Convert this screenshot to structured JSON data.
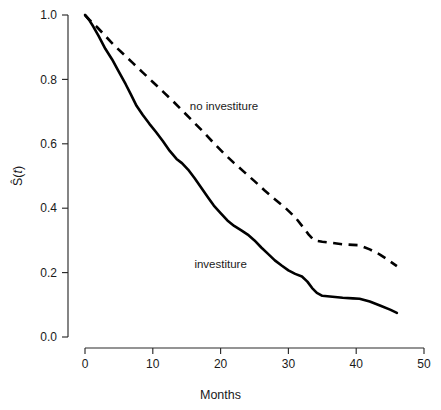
{
  "chart_data": {
    "type": "line",
    "title": "",
    "subtitle": "",
    "xlabel": "Months",
    "ylabel": "Ŝ(t)",
    "xlim": [
      0,
      50
    ],
    "ylim": [
      0.0,
      1.0
    ],
    "xticks": [
      "0",
      "10",
      "20",
      "30",
      "40",
      "50"
    ],
    "xtick_values": [
      0,
      10,
      20,
      30,
      40,
      50
    ],
    "yticks": [
      "0.0",
      "0.2",
      "0.4",
      "0.6",
      "0.8",
      "1.0"
    ],
    "ytick_values": [
      0.0,
      0.2,
      0.4,
      0.6,
      0.8,
      1.0
    ],
    "grid": false,
    "legend_position": "inline-annotation",
    "annotations": [
      {
        "text": "no investiture",
        "x": 20.5,
        "y": 0.705
      },
      {
        "text": "investiture",
        "x": 20.0,
        "y": 0.215
      }
    ],
    "series": [
      {
        "name": "investiture",
        "style": "solid",
        "color": "#000000",
        "x": [
          0,
          0.6,
          1.2,
          2.0,
          3.0,
          4.0,
          5.0,
          6.0,
          6.8,
          7.6,
          8.5,
          9.5,
          10.5,
          11.5,
          12.5,
          13.5,
          14.3,
          15.2,
          16.2,
          17.2,
          18.2,
          19.0,
          20.0,
          21.0,
          22.0,
          23.0,
          24.0,
          25.0,
          26.0,
          27.0,
          28.0,
          29.0,
          30.0,
          31.0,
          32.0,
          32.8,
          33.5,
          34.2,
          35.0,
          36.5,
          38.0,
          39.5,
          40.5,
          42.0,
          43.5,
          45.0,
          46.0
        ],
        "y": [
          1.0,
          0.985,
          0.965,
          0.935,
          0.895,
          0.862,
          0.823,
          0.785,
          0.752,
          0.718,
          0.69,
          0.662,
          0.636,
          0.608,
          0.578,
          0.553,
          0.54,
          0.52,
          0.492,
          0.462,
          0.432,
          0.408,
          0.385,
          0.362,
          0.345,
          0.332,
          0.318,
          0.3,
          0.278,
          0.258,
          0.238,
          0.222,
          0.207,
          0.196,
          0.188,
          0.172,
          0.152,
          0.137,
          0.128,
          0.125,
          0.122,
          0.12,
          0.119,
          0.11,
          0.098,
          0.085,
          0.075
        ]
      },
      {
        "name": "no investiture",
        "style": "dashed",
        "color": "#000000",
        "x": [
          0,
          0.8,
          1.8,
          3.0,
          4.2,
          5.5,
          7.0,
          8.5,
          10.0,
          11.5,
          13.0,
          14.5,
          16.0,
          17.5,
          19.0,
          20.5,
          22.0,
          23.5,
          25.0,
          26.5,
          28.0,
          29.5,
          31.0,
          32.2,
          33.0,
          33.8,
          35.0,
          36.5,
          38.0,
          39.5,
          40.5,
          42.0,
          43.5,
          45.0,
          46.0
        ],
        "y": [
          1.0,
          0.982,
          0.962,
          0.935,
          0.908,
          0.882,
          0.852,
          0.822,
          0.792,
          0.762,
          0.732,
          0.7,
          0.668,
          0.636,
          0.602,
          0.57,
          0.54,
          0.512,
          0.484,
          0.455,
          0.428,
          0.402,
          0.372,
          0.34,
          0.318,
          0.3,
          0.296,
          0.292,
          0.288,
          0.286,
          0.285,
          0.272,
          0.256,
          0.235,
          0.22
        ]
      }
    ]
  },
  "figure": {
    "background_color": "#ffffff",
    "axis_color": "#2b2b2b",
    "text_color": "#1a1a1a"
  }
}
